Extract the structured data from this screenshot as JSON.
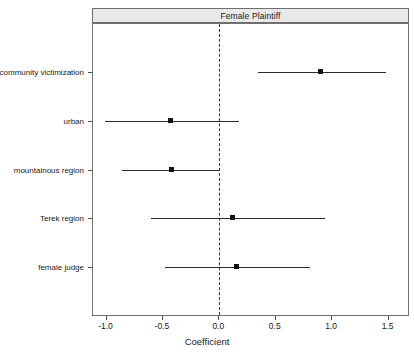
{
  "chart_data": {
    "type": "scatter",
    "title": "Female Plaintiff",
    "xlabel": "Coefficient",
    "ylabel": "",
    "xlim": [
      -1.12,
      1.69
    ],
    "ylim": [
      0,
      6
    ],
    "grid": false,
    "legend": null,
    "reference_line": 0.0,
    "xticks": [
      -1.0,
      -0.5,
      0.0,
      0.5,
      1.0,
      1.5
    ],
    "xticklabels": [
      "-1.0",
      "-0.5",
      "0.0",
      "0.5",
      "1.0",
      "1.5"
    ],
    "categories": [
      "community victimization",
      "urban",
      "mountainous region",
      "Terek region",
      "female judge"
    ],
    "points": [
      {
        "label": "community victimization",
        "estimate": 0.9,
        "ci_low": 0.34,
        "ci_high": 1.48
      },
      {
        "label": "urban",
        "estimate": -0.43,
        "ci_low": -1.01,
        "ci_high": 0.17
      },
      {
        "label": "mountainous region",
        "estimate": -0.42,
        "ci_low": -0.86,
        "ci_high": 0.01
      },
      {
        "label": "Terek region",
        "estimate": 0.12,
        "ci_low": -0.61,
        "ci_high": 0.94
      },
      {
        "label": "female judge",
        "estimate": 0.15,
        "ci_low": -0.48,
        "ci_high": 0.8
      }
    ]
  },
  "colors": {
    "strip_background": "#e9e9e9",
    "panel_border": "#6f6f6f",
    "interval": "#2b2b2b",
    "point": "#111111",
    "reference_line": "#3a3a3a",
    "text": "#1a1a1a",
    "background": "#ffffff"
  }
}
